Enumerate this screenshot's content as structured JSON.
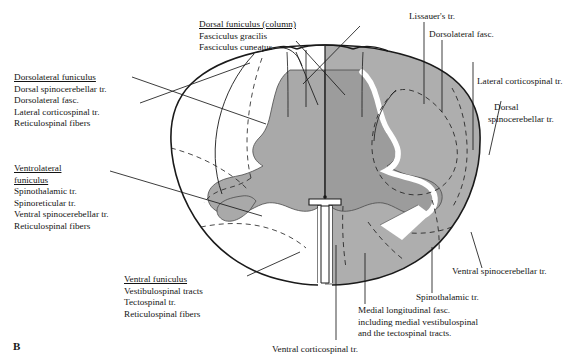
{
  "figure": {
    "letter": "B",
    "caption_letter_name": "figure-panel-letter"
  },
  "colors": {
    "gray_matter": "#a9a9a9",
    "white_matter_shaded": "#aeaeae",
    "white_matter_unshaded": "#ffffff",
    "outline": "#1a1a1a",
    "background": "#ffffff"
  },
  "labels": {
    "dorsal_funiculus": {
      "heading": "Dorsal funiculus (column)",
      "items": [
        "Fasciculus gracilis",
        "Fasciculus cuneatus"
      ]
    },
    "dorsolateral_funiculus": {
      "heading": "Dorsolateral funiculus",
      "items": [
        "Dorsal spinocerebellar tr.",
        "Dorsolateral fasc.",
        "Lateral corticospinal tr.",
        "Reticulospinal fibers"
      ]
    },
    "ventrolateral_funiculus": {
      "heading_line1": "Ventrolateral",
      "heading_line2": "funiculus",
      "items": [
        "Spinothalamic tr.",
        "Spinoreticular tr.",
        "Ventral spinocerebellar tr.",
        "Reticulospinal fibers"
      ]
    },
    "ventral_funiculus": {
      "heading": "Ventral funiculus",
      "items": [
        "Vestibulospinal tracts",
        "Tectospinal tr.",
        "Reticulospinal fibers"
      ]
    },
    "lissauers_tract": "Lissauer's tr.",
    "dorsolateral_fasciculus": "Dorsolateral fasc.",
    "lateral_corticospinal": "Lateral corticospinal tr.",
    "dorsal_spinocerebellar": {
      "line1": "Dorsal",
      "line2": "spinocerebellar tr."
    },
    "ventral_spinocerebellar": "Ventral spinocerebellar tr.",
    "spinothalamic": "Spinothalamic tr.",
    "medial_longitudinal_fasc": {
      "line1": "Medial longitudinal fasc.",
      "line2": "including medial vestibulospinal",
      "line3": "and the tectospinal tracts."
    },
    "ventral_corticospinal": "Ventral corticospinal tr."
  }
}
